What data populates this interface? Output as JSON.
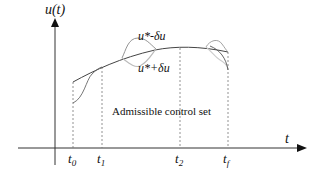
{
  "diagram": {
    "y_axis_label": "u(t)",
    "x_axis_label": "t",
    "center_text": "Admissible control set",
    "curve_labels": {
      "minus": "u*-δu",
      "plus": "u*+δu"
    },
    "time_ticks": [
      {
        "id": "t0",
        "base": "t",
        "sub": "0"
      },
      {
        "id": "t1",
        "base": "t",
        "sub": "1"
      },
      {
        "id": "t2",
        "base": "t",
        "sub": "2"
      },
      {
        "id": "tf",
        "base": "t",
        "sub": "f"
      }
    ],
    "colors": {
      "axis": "#333333",
      "optimal_curve": "#444444",
      "perturbation_curve": "#666666",
      "perturbation_light": "#bbbbbb",
      "dashed": "#777777"
    }
  }
}
